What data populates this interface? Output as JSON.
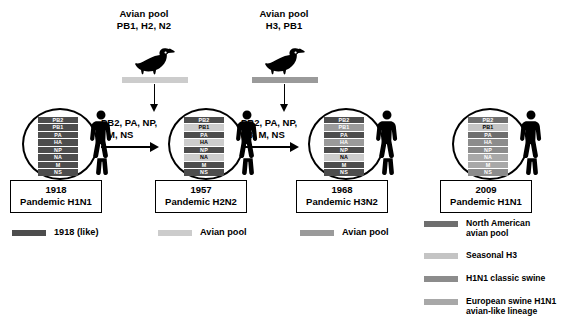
{
  "figure": {
    "colors": {
      "human_1918_like": "#4d4d4d",
      "avian_pool_light": "#cccccc",
      "avian_pool_mid": "#9a9a9a",
      "north_american_avian": "#6e6e6e",
      "seasonal_h3": "#c4c4c4",
      "h1n1_classic_swine": "#8c8c8c",
      "european_swine": "#a8a8a8",
      "outline": "#000000",
      "background": "#ffffff"
    }
  },
  "pools": [
    {
      "id": "pool-1957",
      "line1": "Avian pool",
      "line2": "PB1, H2, N2",
      "bar_color": "#cccccc",
      "icon": "duck-icon"
    },
    {
      "id": "pool-1968",
      "line1": "Avian pool",
      "line2": "H3, PB1",
      "bar_color": "#9a9a9a",
      "icon": "duck-icon"
    }
  ],
  "reassortment_arrows": [
    {
      "id": "arrow-1918-to-1957",
      "line1": "PB2, PA, NP,",
      "line2": "M, NS"
    },
    {
      "id": "arrow-1957-to-1968",
      "line1": "PB2, PA, NP,",
      "line2": "N3, M, NS"
    }
  ],
  "strains": [
    {
      "id": "strain-1918",
      "year": "1918",
      "name": "Pandemic H1N1",
      "segments": [
        {
          "gene": "PB2",
          "color": "#4d4d4d"
        },
        {
          "gene": "PB1",
          "color": "#4d4d4d"
        },
        {
          "gene": "PA",
          "color": "#4d4d4d"
        },
        {
          "gene": "HA",
          "color": "#4d4d4d"
        },
        {
          "gene": "NP",
          "color": "#4d4d4d"
        },
        {
          "gene": "NA",
          "color": "#4d4d4d"
        },
        {
          "gene": "M",
          "color": "#4d4d4d"
        },
        {
          "gene": "NS",
          "color": "#4d4d4d"
        }
      ]
    },
    {
      "id": "strain-1957",
      "year": "1957",
      "name": "Pandemic H2N2",
      "segments": [
        {
          "gene": "PB2",
          "color": "#4d4d4d"
        },
        {
          "gene": "PB1",
          "color": "#cccccc"
        },
        {
          "gene": "PA",
          "color": "#4d4d4d"
        },
        {
          "gene": "HA",
          "color": "#cccccc"
        },
        {
          "gene": "NP",
          "color": "#4d4d4d"
        },
        {
          "gene": "NA",
          "color": "#cccccc"
        },
        {
          "gene": "M",
          "color": "#4d4d4d"
        },
        {
          "gene": "NS",
          "color": "#4d4d4d"
        }
      ]
    },
    {
      "id": "strain-1968",
      "year": "1968",
      "name": "Pandemic H3N2",
      "segments": [
        {
          "gene": "PB2",
          "color": "#4d4d4d"
        },
        {
          "gene": "PB1",
          "color": "#9a9a9a"
        },
        {
          "gene": "PA",
          "color": "#4d4d4d"
        },
        {
          "gene": "HA",
          "color": "#9a9a9a"
        },
        {
          "gene": "NP",
          "color": "#4d4d4d"
        },
        {
          "gene": "NA",
          "color": "#cccccc"
        },
        {
          "gene": "M",
          "color": "#4d4d4d"
        },
        {
          "gene": "NS",
          "color": "#4d4d4d"
        }
      ]
    },
    {
      "id": "strain-2009",
      "year": "2009",
      "name": "Pandemic H1N1",
      "segments": [
        {
          "gene": "PB2",
          "color": "#6e6e6e"
        },
        {
          "gene": "PB1",
          "color": "#c4c4c4"
        },
        {
          "gene": "PA",
          "color": "#6e6e6e"
        },
        {
          "gene": "HA",
          "color": "#8c8c8c"
        },
        {
          "gene": "NP",
          "color": "#8c8c8c"
        },
        {
          "gene": "NA",
          "color": "#a8a8a8"
        },
        {
          "gene": "M",
          "color": "#a8a8a8"
        },
        {
          "gene": "NS",
          "color": "#8c8c8c"
        }
      ]
    }
  ],
  "legend_bottom": [
    {
      "id": "legend-1918-like",
      "label": "1918 (like)",
      "color": "#4d4d4d"
    },
    {
      "id": "legend-avian-pool-light",
      "label": "Avian pool",
      "color": "#cccccc"
    },
    {
      "id": "legend-avian-pool-mid",
      "label": "Avian pool",
      "color": "#9a9a9a"
    }
  ],
  "legend_right": [
    {
      "id": "legend-north-american-avian",
      "label": "North American\navian pool",
      "color": "#6e6e6e"
    },
    {
      "id": "legend-seasonal-h3",
      "label": "Seasonal H3",
      "color": "#c4c4c4"
    },
    {
      "id": "legend-h1n1-classic-swine",
      "label": "H1N1 classic swine",
      "color": "#8c8c8c"
    },
    {
      "id": "legend-european-swine",
      "label": "European swine H1N1\navian-like lineage",
      "color": "#a8a8a8"
    }
  ]
}
